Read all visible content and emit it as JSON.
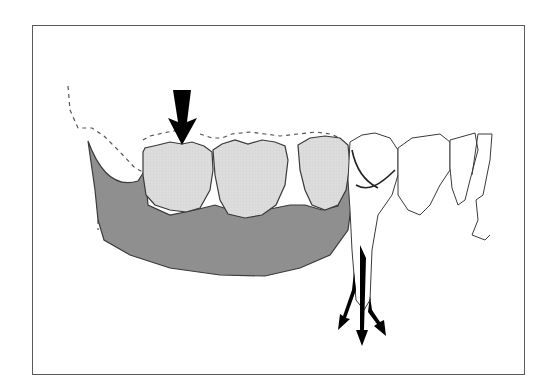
{
  "figure": {
    "colors": {
      "frame": "#5a5a5a",
      "bone": "#8f8f8f",
      "crown": "#dcdcdc",
      "outline": "#3a3a3a",
      "arrow": "#000000",
      "gingiva_dashed": "#555555",
      "background": "#ffffff"
    },
    "elements": {
      "occlusal_force_arrow": "down-arrow",
      "root_force_arrows": [
        "down-left-arrow",
        "down-arrow",
        "down-right-arrow"
      ]
    }
  }
}
